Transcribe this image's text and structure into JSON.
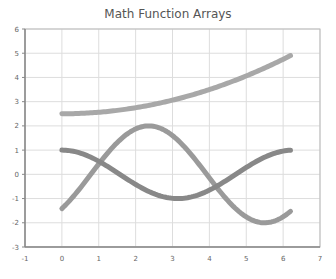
{
  "chart_data": {
    "type": "line",
    "title": "Math Function Arrays",
    "xlabel": "",
    "ylabel": "",
    "xlim": [
      -1,
      7
    ],
    "ylim": [
      -3,
      6
    ],
    "xticks": [
      "-1",
      "0",
      "1",
      "2",
      "3",
      "4",
      "5",
      "6",
      "7"
    ],
    "yticks": [
      "-3",
      "-2",
      "-1",
      "0",
      "1",
      "2",
      "3",
      "4",
      "5",
      "6"
    ],
    "grid": true,
    "legend": null,
    "x": [
      0,
      0.5,
      1.0,
      1.5,
      2.0,
      2.5,
      3.0,
      3.5,
      4.0,
      4.5,
      5.0,
      5.5,
      6.0,
      6.2
    ],
    "series": [
      {
        "name": "2.5 + x^2/16",
        "color": "#a8a8a8",
        "values": [
          2.5,
          2.52,
          2.56,
          2.64,
          2.75,
          2.89,
          3.06,
          3.27,
          3.5,
          3.77,
          4.06,
          4.39,
          4.75,
          4.9
        ]
      },
      {
        "name": "2*sin(x - pi/4)",
        "color": "#9a9a9a",
        "values": [
          -1.41,
          -0.55,
          0.43,
          1.3,
          1.86,
          1.99,
          1.65,
          0.93,
          0.0,
          -0.92,
          -1.64,
          -1.99,
          -1.87,
          -1.74
        ]
      },
      {
        "name": "cos(x)",
        "color": "#888888",
        "values": [
          1.0,
          0.88,
          0.54,
          0.07,
          -0.42,
          -0.8,
          -0.99,
          -0.94,
          -0.65,
          -0.21,
          0.28,
          0.71,
          0.96,
          1.0
        ]
      }
    ]
  },
  "ui": {
    "plot": {
      "left": 25,
      "right": 320,
      "top": 29,
      "bottom": 247
    },
    "grid_color": "#dddddd",
    "axis_color": "#888888"
  }
}
